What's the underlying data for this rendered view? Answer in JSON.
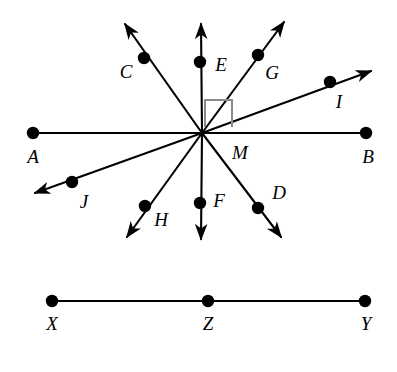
{
  "figure": {
    "background_color": "#ffffff",
    "stroke_color": "#000000",
    "width": 397,
    "height": 372
  },
  "chart_data": {
    "type": "diagram",
    "xlabel": "",
    "ylabel": "",
    "xlim": [
      0,
      397
    ],
    "ylim": [
      372,
      0
    ],
    "grid": false,
    "legend": "none",
    "center": {
      "name": "M",
      "x": 202,
      "y": 133
    },
    "points": [
      {
        "name": "A",
        "x": 33,
        "y": 133,
        "label_x": 33,
        "label_y": 156,
        "dot": true
      },
      {
        "name": "B",
        "x": 366,
        "y": 133,
        "label_x": 368,
        "label_y": 156,
        "dot": true
      },
      {
        "name": "C",
        "x": 144,
        "y": 58,
        "label_x": 126,
        "label_y": 71,
        "dot": true
      },
      {
        "name": "D",
        "x": 258,
        "y": 208,
        "label_x": 279,
        "label_y": 192,
        "dot": true
      },
      {
        "name": "E",
        "x": 200,
        "y": 62,
        "label_x": 221,
        "label_y": 64,
        "dot": true
      },
      {
        "name": "F",
        "x": 200,
        "y": 203,
        "label_x": 219,
        "label_y": 200,
        "dot": true
      },
      {
        "name": "G",
        "x": 258,
        "y": 55,
        "label_x": 272,
        "label_y": 72,
        "dot": true
      },
      {
        "name": "H",
        "x": 145,
        "y": 206,
        "label_x": 161,
        "label_y": 219,
        "dot": true
      },
      {
        "name": "I",
        "x": 330,
        "y": 82,
        "label_x": 339,
        "label_y": 101,
        "dot": true
      },
      {
        "name": "J",
        "x": 72,
        "y": 182,
        "label_x": 84,
        "label_y": 201,
        "dot": true
      },
      {
        "name": "M",
        "x": 202,
        "y": 133,
        "label_x": 240,
        "label_y": 152,
        "dot": false
      },
      {
        "name": "X",
        "x": 52,
        "y": 301,
        "label_x": 52,
        "label_y": 323,
        "dot": true
      },
      {
        "name": "Z",
        "x": 208,
        "y": 301,
        "label_x": 208,
        "label_y": 323,
        "dot": true
      },
      {
        "name": "Y",
        "x": 365,
        "y": 301,
        "label_x": 366,
        "label_y": 323,
        "dot": true
      }
    ],
    "segments": [
      {
        "name": "segment-AB",
        "x1": 33,
        "y1": 133,
        "x2": 366,
        "y2": 133,
        "arrow_start": false,
        "arrow_end": false
      },
      {
        "name": "segment-XY",
        "x1": 52,
        "y1": 301,
        "x2": 365,
        "y2": 301,
        "arrow_start": false,
        "arrow_end": false
      }
    ],
    "rays": [
      {
        "name": "ray-MC",
        "x1": 202,
        "y1": 133,
        "x2": 125,
        "y2": 24,
        "through": "C",
        "arrow_end": true
      },
      {
        "name": "ray-ME",
        "x1": 202,
        "y1": 133,
        "x2": 201,
        "y2": 24,
        "through": "E",
        "arrow_end": true
      },
      {
        "name": "ray-MG",
        "x1": 202,
        "y1": 133,
        "x2": 284,
        "y2": 22,
        "through": "G",
        "arrow_end": true
      },
      {
        "name": "ray-MI",
        "x1": 202,
        "y1": 133,
        "x2": 371,
        "y2": 71,
        "through": "I",
        "arrow_end": true
      },
      {
        "name": "ray-MD",
        "x1": 202,
        "y1": 133,
        "x2": 281,
        "y2": 237,
        "through": "D",
        "arrow_end": true
      },
      {
        "name": "ray-MF",
        "x1": 202,
        "y1": 133,
        "x2": 201,
        "y2": 239,
        "through": "F",
        "arrow_end": true
      },
      {
        "name": "ray-MH",
        "x1": 202,
        "y1": 133,
        "x2": 127,
        "y2": 237,
        "through": "H",
        "arrow_end": true
      },
      {
        "name": "ray-MJ",
        "x1": 202,
        "y1": 133,
        "x2": 35,
        "y2": 193,
        "through": "J",
        "arrow_end": true
      }
    ],
    "right_angle_marker": {
      "name": "right-angle-EMG-region",
      "description": "square marker between ray ME and ray MI indicating 90 degrees",
      "x": 205,
      "y": 100,
      "size": 27,
      "color": "#8a8a8a"
    },
    "annotations": [
      "Eight rays emanate from center point M",
      "Line AB is horizontal through M",
      "Right angle marked between the upward vertical ray ME and ray MI",
      "Separate segment X-Z-Y lies below with Z between X and Y"
    ]
  },
  "labels": {
    "A": "A",
    "B": "B",
    "C": "C",
    "D": "D",
    "E": "E",
    "F": "F",
    "G": "G",
    "H": "H",
    "I": "I",
    "J": "J",
    "M": "M",
    "X": "X",
    "Y": "Y",
    "Z": "Z"
  }
}
